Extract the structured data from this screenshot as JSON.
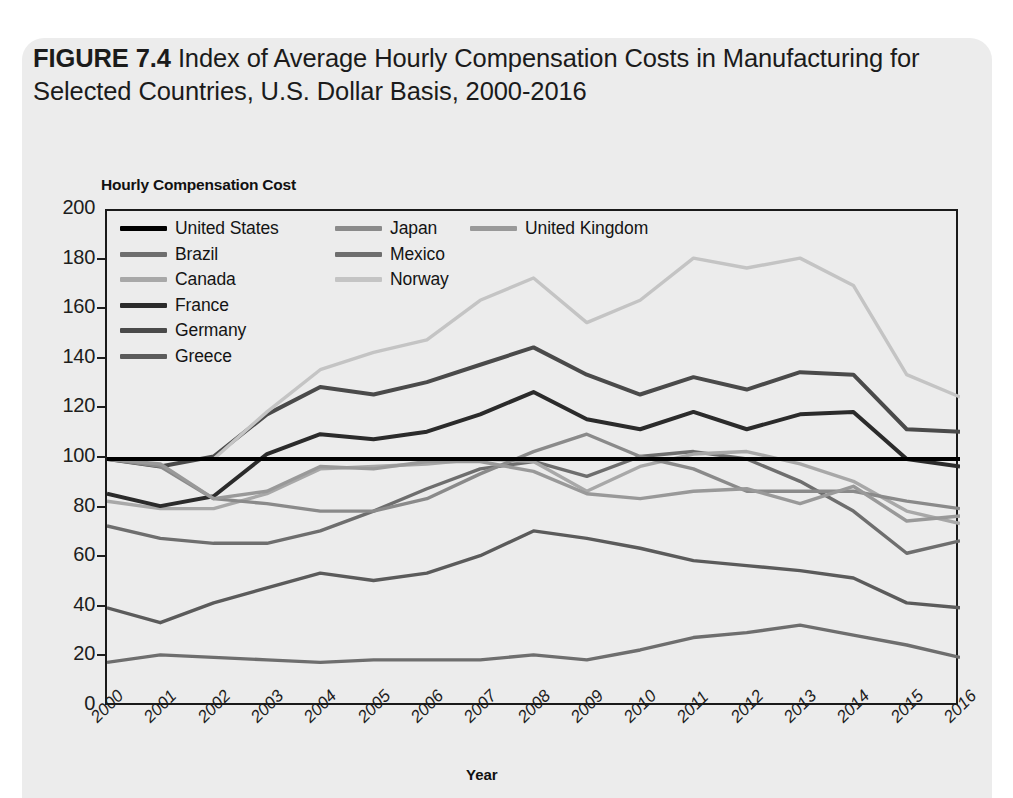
{
  "figure": {
    "number": "FIGURE 7.4",
    "title": "Index of Average Hourly Compensation Costs in Manufacturing for Selected Countries, U.S. Dollar Basis, 2000-2016"
  },
  "chart_data": {
    "type": "line",
    "title": "Index of Average Hourly Compensation Costs in Manufacturing for Selected Countries, U.S. Dollar Basis, 2000-2016",
    "ylabel": "Hourly Compensation Cost",
    "xlabel": "Year",
    "ylim": [
      0,
      200
    ],
    "yticks": [
      0,
      20,
      40,
      60,
      80,
      100,
      120,
      140,
      160,
      180,
      200
    ],
    "grid": false,
    "legend_position": "top-left inside plot",
    "x": [
      "2000",
      "2001",
      "2002",
      "2003",
      "2004",
      "2005",
      "2006",
      "2007",
      "2008",
      "2009",
      "2010",
      "2011",
      "2012",
      "2013",
      "2014",
      "2015",
      "2016"
    ],
    "series": [
      {
        "name": "United States",
        "color": "#000000",
        "width": 4.2,
        "values": [
          100,
          100,
          100,
          100,
          100,
          100,
          100,
          100,
          100,
          100,
          100,
          100,
          100,
          100,
          100,
          100,
          100
        ]
      },
      {
        "name": "Brazil",
        "color": "#6e6e6e",
        "width": 3.4,
        "values": [
          73,
          68,
          66,
          66,
          71,
          79,
          88,
          96,
          99,
          93,
          101,
          103,
          100,
          91,
          79,
          62,
          67
        ]
      },
      {
        "name": "Canada",
        "color": "#a8a8a8",
        "width": 3.4,
        "values": [
          83,
          80,
          80,
          86,
          96,
          97,
          98,
          100,
          99,
          87,
          97,
          102,
          103,
          98,
          91,
          79,
          74
        ]
      },
      {
        "name": "France",
        "color": "#2b2b2b",
        "width": 4.0,
        "values": [
          86,
          81,
          85,
          102,
          110,
          108,
          111,
          118,
          127,
          116,
          112,
          119,
          112,
          118,
          119,
          100,
          97
        ]
      },
      {
        "name": "Germany",
        "color": "#4a4a4a",
        "width": 4.0,
        "values": [
          100,
          97,
          101,
          118,
          129,
          126,
          131,
          138,
          145,
          134,
          126,
          133,
          128,
          135,
          134,
          112,
          111
        ]
      },
      {
        "name": "Greece",
        "color": "#5b5b5b",
        "width": 3.4,
        "values": [
          40,
          34,
          42,
          48,
          54,
          51,
          54,
          61,
          71,
          68,
          64,
          59,
          57,
          55,
          52,
          42,
          40
        ]
      },
      {
        "name": "Japan",
        "color": "#8a8a8a",
        "width": 3.4,
        "values": [
          100,
          97,
          84,
          82,
          79,
          79,
          84,
          94,
          103,
          110,
          101,
          96,
          87,
          87,
          87,
          83,
          80
        ]
      },
      {
        "name": "Mexico",
        "color": "#6e6e6e",
        "width": 3.4,
        "values": [
          18,
          21,
          20,
          19,
          18,
          19,
          19,
          19,
          21,
          19,
          23,
          28,
          30,
          33,
          29,
          25,
          20
        ]
      },
      {
        "name": "Norway",
        "color": "#c4c4c4",
        "width": 3.4,
        "values": [
          100,
          100,
          100,
          119,
          136,
          143,
          148,
          164,
          173,
          155,
          164,
          181,
          177,
          181,
          170,
          134,
          125
        ]
      },
      {
        "name": "United Kingdom",
        "color": "#999999",
        "width": 3.4,
        "values": [
          100,
          98,
          84,
          87,
          97,
          96,
          99,
          99,
          95,
          86,
          84,
          87,
          88,
          82,
          89,
          75,
          77
        ]
      }
    ]
  },
  "legend": {
    "rows": [
      [
        {
          "label": "United States",
          "color": "#000000",
          "height": "5px"
        },
        {
          "label": "Japan",
          "color": "#8a8a8a",
          "height": "5px"
        },
        {
          "label": "United Kingdom",
          "color": "#999999",
          "height": "5px"
        }
      ],
      [
        {
          "label": "Brazil",
          "color": "#6e6e6e",
          "height": "5px"
        },
        {
          "label": "Mexico",
          "color": "#6e6e6e",
          "height": "5px"
        }
      ],
      [
        {
          "label": "Canada",
          "color": "#a8a8a8",
          "height": "5px"
        },
        {
          "label": "Norway",
          "color": "#c4c4c4",
          "height": "5px"
        }
      ],
      [
        {
          "label": "France",
          "color": "#2b2b2b",
          "height": "5px"
        }
      ],
      [
        {
          "label": "Germany",
          "color": "#4a4a4a",
          "height": "5px"
        }
      ],
      [
        {
          "label": "Greece",
          "color": "#5b5b5b",
          "height": "5px"
        }
      ]
    ]
  }
}
